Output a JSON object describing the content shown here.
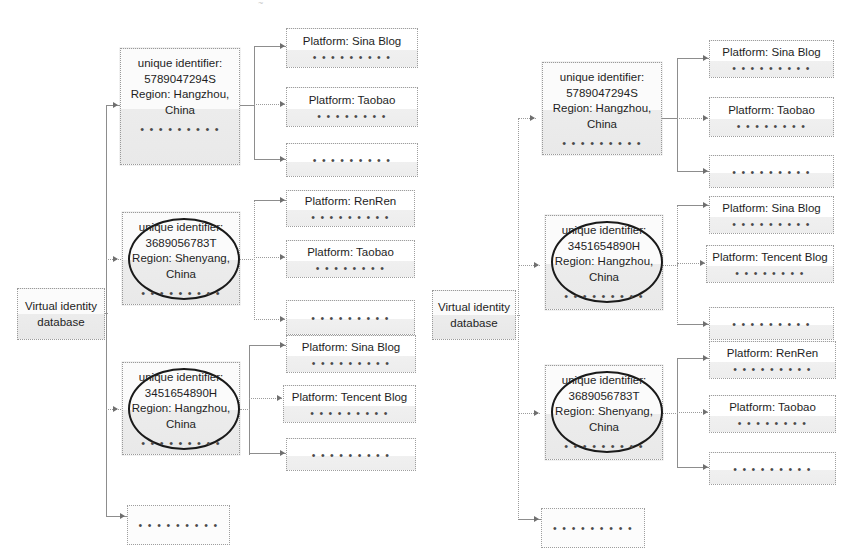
{
  "diagram": {
    "dots_short": "• • • • • • • • •",
    "dots_long": "• • • • • • • • • •",
    "dots_tail": "••"
  },
  "left_panel": {
    "database": {
      "line1": "Virtual identity",
      "line2": "database"
    },
    "identities": [
      {
        "id_label": "unique identifier:",
        "id_value": "5789047294S",
        "region_label": "Region: Hangzhou,",
        "region_label2": "China",
        "dots": "• • • • • • • • •",
        "highlighted": false
      },
      {
        "id_label": "unique identifier:",
        "id_value": "3689056783T",
        "region_label": "Region: Shenyang,",
        "region_label2": "China",
        "dots": "• • • • • • • • •",
        "highlighted": true
      },
      {
        "id_label": "unique identifier:",
        "id_value": "3451654890H",
        "region_label": "Region: Hangzhou,",
        "region_label2": "China",
        "dots": "• • • • • • • • •",
        "highlighted": true
      }
    ],
    "platform_groups": [
      [
        {
          "label": "Platform: Sina Blog",
          "dots": "• • • • • • • • •"
        },
        {
          "label": "Platform: Taobao",
          "dots": "• • • • • • • •"
        },
        {
          "label": "",
          "dots": "• • • • • • • • •"
        }
      ],
      [
        {
          "label": "Platform: RenRen",
          "dots": "• • • • • • • • •"
        },
        {
          "label": "Platform: Taobao",
          "dots": "• • • • • • • •"
        },
        {
          "label": "",
          "dots": "• • • • • • • • •"
        }
      ],
      [
        {
          "label": "Platform: Sina Blog",
          "dots": "• • • • • • • • •"
        },
        {
          "label": "Platform: Tencent Blog",
          "dots": "• • • • • • • • •"
        },
        {
          "label": "",
          "dots": "• • • • • • • • •"
        }
      ]
    ],
    "overflow_box": {
      "dots": "• • • • • • • • •"
    }
  },
  "right_panel": {
    "database": {
      "line1": "Virtual identity",
      "line2": "database"
    },
    "identities": [
      {
        "id_label": "unique identifier:",
        "id_value": "5789047294S",
        "region_label": "Region: Hangzhou,",
        "region_label2": "China",
        "dots": "• • • • • • • • •",
        "highlighted": false
      },
      {
        "id_label": "unique identifier:",
        "id_value": "3451654890H",
        "region_label": "Region: Hangzhou,",
        "region_label2": "China",
        "dots": "• • • • • • • • •",
        "highlighted": true
      },
      {
        "id_label": "unique identifier:",
        "id_value": "3689056783T",
        "region_label": "Region: Shenyang,",
        "region_label2": "China",
        "dots": "• • • • • • • • •",
        "highlighted": true
      }
    ],
    "platform_groups": [
      [
        {
          "label": "Platform: Sina Blog",
          "dots": "• • • • • • • • •"
        },
        {
          "label": "Platform: Taobao",
          "dots": "• • • • • • • •"
        },
        {
          "label": "",
          "dots": "• • • • • • • • •"
        }
      ],
      [
        {
          "label": "Platform: Sina Blog",
          "dots": "• • • • • • • • •"
        },
        {
          "label": "Platform: Tencent Blog",
          "dots": "• • • • • • • •"
        },
        {
          "label": "",
          "dots": "• • • • • • • • •"
        }
      ],
      [
        {
          "label": "Platform: RenRen",
          "dots": "• • • • • • • • •"
        },
        {
          "label": "Platform: Taobao",
          "dots": "• • • • • • • •"
        },
        {
          "label": "",
          "dots": "• • • • • • • • •"
        }
      ]
    ],
    "overflow_box": {
      "dots": "• • • • • • • • •"
    }
  }
}
